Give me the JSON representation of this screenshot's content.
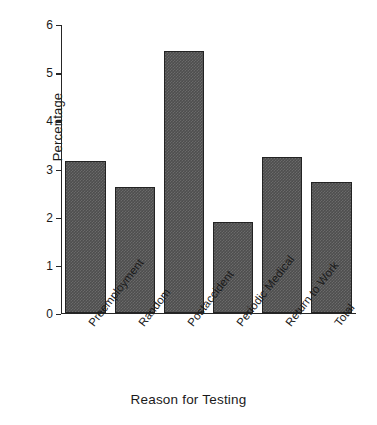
{
  "chart_data": {
    "type": "bar",
    "title": "",
    "xlabel": "Reason for Testing",
    "ylabel": "Percentage",
    "categories": [
      "Preemployment",
      "Random",
      "Postaccident",
      "Periodic Medical",
      "Return to Work",
      "Total"
    ],
    "values": [
      3.15,
      2.62,
      5.45,
      1.88,
      3.24,
      2.72
    ],
    "ylim": [
      0,
      6
    ],
    "yticks": [
      0,
      1,
      2,
      3,
      4,
      5,
      6
    ],
    "ytick_labels": [
      "0",
      "1",
      "2",
      "3",
      "4",
      "5",
      "6"
    ],
    "grid": false,
    "legend": false,
    "bar_color": "#4e4e4e",
    "bar_edge_color": "#232323",
    "axis_color": "#262626",
    "background": "#ffffff"
  }
}
